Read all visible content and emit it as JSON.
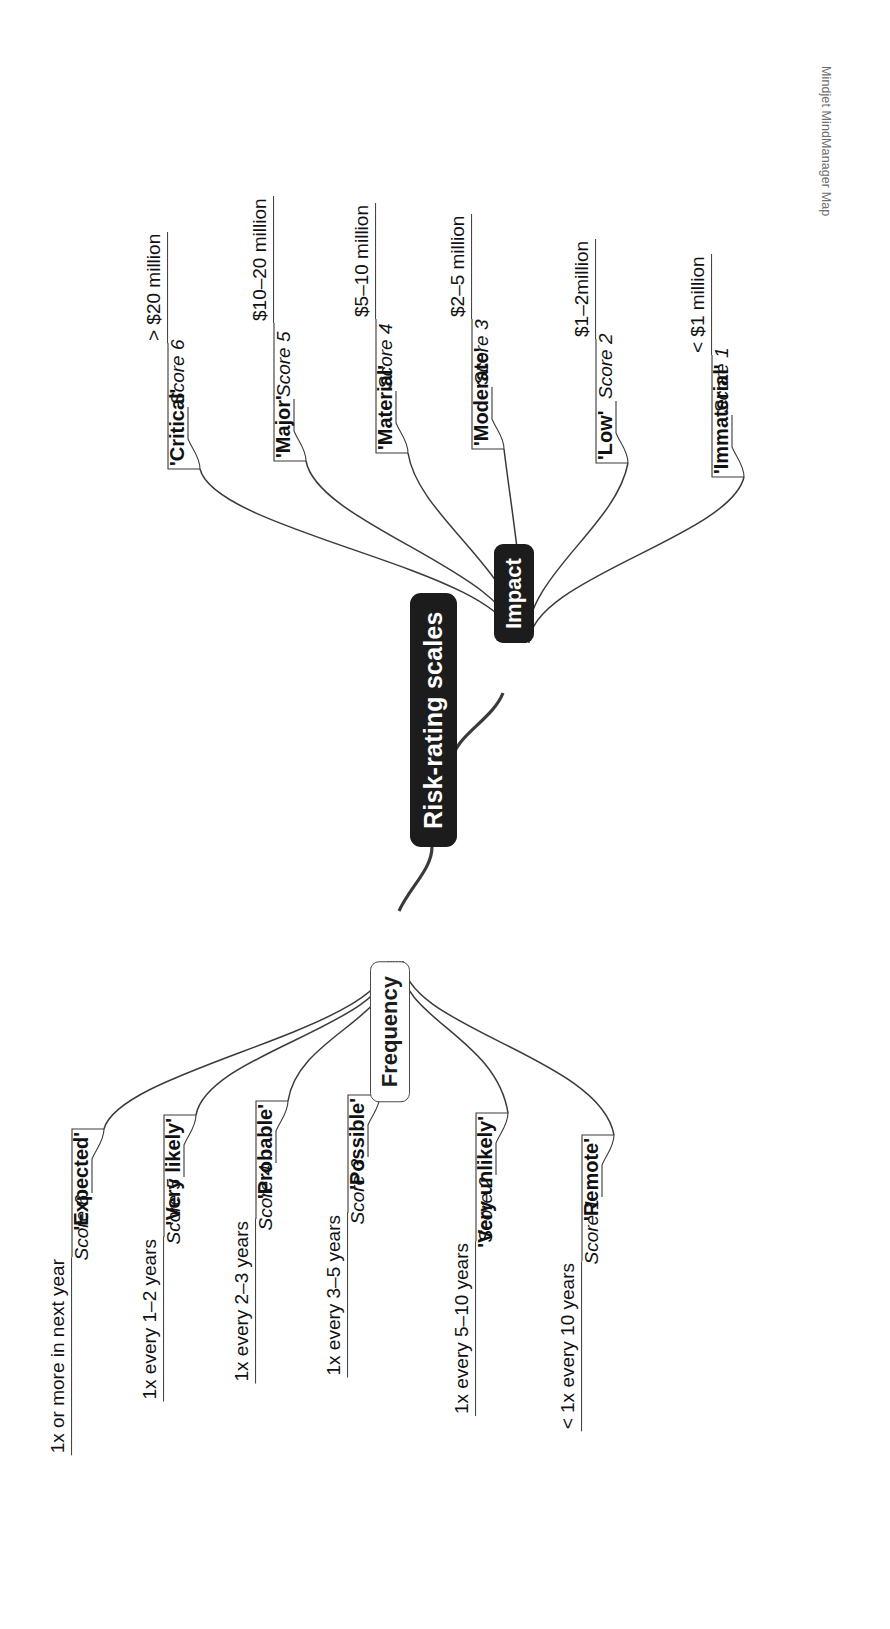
{
  "watermark": "Mindjet MindManager Map",
  "central": {
    "label": "Risk-rating scales"
  },
  "branches": [
    {
      "id": "frequency",
      "label": "Frequency",
      "style": "light",
      "children": [
        {
          "label": "'Expected'",
          "detail": "1x or more in next year",
          "score": "Score 6"
        },
        {
          "label": "'Very likely'",
          "detail": "1x every 1–2 years",
          "score": "Score 5"
        },
        {
          "label": "'Probable'",
          "detail": "1x every 2–3 years",
          "score": "Score 4"
        },
        {
          "label": "'Possible'",
          "detail": "1x every 3–5 years",
          "score": "Score 3"
        },
        {
          "label": "'Very unlikely'",
          "detail": "1x every 5–10 years",
          "score": "Score 2"
        },
        {
          "label": "'Remote'",
          "detail": "< 1x every 10 years",
          "score": "Score 1"
        }
      ]
    },
    {
      "id": "impact",
      "label": "Impact",
      "style": "dark",
      "children": [
        {
          "label": "'Critical'",
          "detail": "> $20 million",
          "score": "Score 6"
        },
        {
          "label": "'Major'",
          "detail": "$10–20 million",
          "score": "Score 5"
        },
        {
          "label": "'Material'",
          "detail": "$5–10 million",
          "score": "Score 4"
        },
        {
          "label": "'Moderate'",
          "detail": "$2–5 million",
          "score": "Score 3"
        },
        {
          "label": "'Low'",
          "detail": "$1–2million",
          "score": "Score 2"
        },
        {
          "label": "'Immaterial'",
          "detail": "< $1 million",
          "score": "Score 1"
        }
      ]
    }
  ],
  "colors": {
    "node_dark": "#1c1c1c",
    "node_text_light": "#ffffff",
    "line": "#3a3a3a",
    "background": "#ffffff"
  }
}
